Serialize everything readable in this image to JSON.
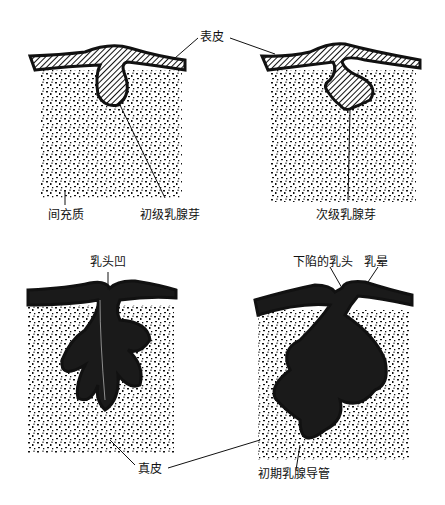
{
  "diagram": {
    "panels": [
      {
        "id": "panel-1",
        "stage": "primary bud"
      },
      {
        "id": "panel-2",
        "stage": "secondary bud"
      },
      {
        "id": "panel-3",
        "stage": "nipple pit"
      },
      {
        "id": "panel-4",
        "stage": "inverted nipple"
      }
    ],
    "labels": {
      "epidermis": "表皮",
      "mesenchyme": "间充质",
      "primary_bud": "初级乳腺芽",
      "secondary_bud": "次级乳腺芽",
      "nipple_pit": "乳头凹",
      "inverted_nipple": "下陷的乳头",
      "areola": "乳晕",
      "dermis": "真皮",
      "primitive_duct": "初期乳腺导管"
    },
    "colors": {
      "ink": "#111111",
      "background": "#ffffff"
    }
  }
}
